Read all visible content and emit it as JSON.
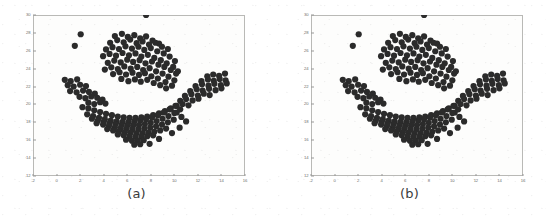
{
  "figure": {
    "background_color": "#ffffff",
    "point_color": "#2b2b2b",
    "frame_color": "#b9b9b6",
    "tick_color": "#6e6e6b"
  },
  "panels": [
    {
      "id": "a",
      "caption": "(a)"
    },
    {
      "id": "b",
      "caption": "(b)"
    }
  ],
  "chart_data": [
    {
      "type": "scatter",
      "title": "",
      "caption": "(a)",
      "xlabel": "",
      "ylabel": "",
      "xlim": [
        -2,
        16
      ],
      "ylim": [
        12,
        30
      ],
      "xticks": [
        -2,
        0,
        2,
        4,
        6,
        8,
        10,
        12,
        14,
        16
      ],
      "xticklabels": [
        "-2",
        "0",
        "2",
        "4",
        "6",
        "8",
        "10",
        "12",
        "14",
        "16"
      ],
      "yticks": [
        12,
        14,
        16,
        18,
        20,
        22,
        24,
        26,
        28,
        30
      ],
      "yticklabels": [
        "12",
        "14",
        "16",
        "18",
        "20",
        "22",
        "24",
        "26",
        "28",
        "30"
      ],
      "grid": false,
      "legend": null,
      "marker": "circle",
      "marker_size": 3.1,
      "series": [
        {
          "name": "points",
          "color": "#2b2b2b",
          "x": [
            2.05,
            1.55,
            4.95,
            5.55,
            6.05,
            6.6,
            7.1,
            7.6,
            8.15,
            8.7,
            4.55,
            5.15,
            5.7,
            6.25,
            6.8,
            7.3,
            7.85,
            8.4,
            8.95,
            9.45,
            4.2,
            4.75,
            5.3,
            5.85,
            6.4,
            6.95,
            7.45,
            8.0,
            8.55,
            9.1,
            9.6,
            10.05,
            3.95,
            4.5,
            5.05,
            5.6,
            6.15,
            6.7,
            7.2,
            7.75,
            8.3,
            8.85,
            9.35,
            9.9,
            10.3,
            4.35,
            4.9,
            5.45,
            6.0,
            6.5,
            7.05,
            7.55,
            8.1,
            8.65,
            9.15,
            9.7,
            10.15,
            4.1,
            4.65,
            5.2,
            5.75,
            6.3,
            6.85,
            7.35,
            7.9,
            8.45,
            9.0,
            9.5,
            10.0,
            4.8,
            5.35,
            5.9,
            6.45,
            7.0,
            7.5,
            8.05,
            8.6,
            9.25,
            9.8,
            5.5,
            6.1,
            6.65,
            7.15,
            7.7,
            8.25,
            8.8,
            9.3,
            0.7,
            1.2,
            1.75,
            0.95,
            1.45,
            2.0,
            2.5,
            1.15,
            1.7,
            2.25,
            2.75,
            3.25,
            1.95,
            2.45,
            2.95,
            3.45,
            3.9,
            2.7,
            3.2,
            3.7,
            4.15,
            12.8,
            13.3,
            13.8,
            14.3,
            12.3,
            12.85,
            13.35,
            13.85,
            14.35,
            11.8,
            12.35,
            12.9,
            13.4,
            13.95,
            14.45,
            11.35,
            11.9,
            12.4,
            12.95,
            13.5,
            14.0,
            10.9,
            11.45,
            12.0,
            12.5,
            13.0,
            10.5,
            11.0,
            11.55,
            12.05,
            10.2,
            10.7,
            11.2,
            2.2,
            2.7,
            3.2,
            3.7,
            4.2,
            4.7,
            5.2,
            5.7,
            6.2,
            6.7,
            7.2,
            7.7,
            8.2,
            8.7,
            9.2,
            9.7,
            10.2,
            2.6,
            3.1,
            3.6,
            4.1,
            4.6,
            5.1,
            5.6,
            6.1,
            6.6,
            7.1,
            7.6,
            8.1,
            8.6,
            9.1,
            9.6,
            10.1,
            10.6,
            3.0,
            3.5,
            4.0,
            4.5,
            5.0,
            5.5,
            6.0,
            6.5,
            7.0,
            7.5,
            8.0,
            8.5,
            9.0,
            9.5,
            10.0,
            10.5,
            11.0,
            3.4,
            3.95,
            4.45,
            4.95,
            5.45,
            5.95,
            6.45,
            6.95,
            7.45,
            7.95,
            8.45,
            8.95,
            9.45,
            9.95,
            10.45,
            4.3,
            4.8,
            5.3,
            5.8,
            6.3,
            6.8,
            7.3,
            7.8,
            8.3,
            8.8,
            9.3,
            9.8,
            5.2,
            5.7,
            6.2,
            6.7,
            7.2,
            7.7,
            8.2,
            8.7,
            5.9,
            6.4,
            6.9,
            7.4,
            7.9,
            6.6,
            7.1,
            7.6
          ],
          "y": [
            27.85,
            26.55,
            27.65,
            27.9,
            27.55,
            27.75,
            27.4,
            27.6,
            27.15,
            26.8,
            26.9,
            27.2,
            26.95,
            27.25,
            26.85,
            27.05,
            26.7,
            26.9,
            26.45,
            26.2,
            26.15,
            26.4,
            26.2,
            26.5,
            26.25,
            26.45,
            26.1,
            26.3,
            25.95,
            25.7,
            25.35,
            24.85,
            25.4,
            25.65,
            25.45,
            25.75,
            25.5,
            25.7,
            25.35,
            25.55,
            25.2,
            24.95,
            24.6,
            24.2,
            23.7,
            24.65,
            24.9,
            24.7,
            25.0,
            24.75,
            24.95,
            24.6,
            24.8,
            24.45,
            24.2,
            23.85,
            23.45,
            23.9,
            24.15,
            23.95,
            24.25,
            24.0,
            24.2,
            23.85,
            24.05,
            23.7,
            23.45,
            23.1,
            22.7,
            23.4,
            23.6,
            23.35,
            23.55,
            23.3,
            23.5,
            23.15,
            22.9,
            22.5,
            22.1,
            22.85,
            22.6,
            22.8,
            22.55,
            22.75,
            22.4,
            22.15,
            21.8,
            22.75,
            22.6,
            22.8,
            22.15,
            22.0,
            22.2,
            22.05,
            21.5,
            21.35,
            21.55,
            21.4,
            21.2,
            20.85,
            20.7,
            20.9,
            20.75,
            20.55,
            20.2,
            20.05,
            20.25,
            20.1,
            23.15,
            23.35,
            23.2,
            23.45,
            22.6,
            22.8,
            22.65,
            22.85,
            22.7,
            22.05,
            22.25,
            22.1,
            22.3,
            22.15,
            22.35,
            21.5,
            21.7,
            21.55,
            21.75,
            21.6,
            21.8,
            20.95,
            21.15,
            21.0,
            21.2,
            21.05,
            20.4,
            20.6,
            20.45,
            20.65,
            19.85,
            20.05,
            19.9,
            19.7,
            19.55,
            19.35,
            19.15,
            18.95,
            18.8,
            18.65,
            18.55,
            18.5,
            18.5,
            18.55,
            18.65,
            18.8,
            19.0,
            19.25,
            19.55,
            19.1,
            18.9,
            18.7,
            18.5,
            18.35,
            18.2,
            18.1,
            18.05,
            18.05,
            18.1,
            18.2,
            18.35,
            18.55,
            18.8,
            19.1,
            19.45,
            19.85,
            18.6,
            18.4,
            18.2,
            18.05,
            17.9,
            17.8,
            17.7,
            17.65,
            17.65,
            17.7,
            17.8,
            17.95,
            18.15,
            18.4,
            18.7,
            19.05,
            19.45,
            18.1,
            17.9,
            17.75,
            17.6,
            17.45,
            17.35,
            17.3,
            17.25,
            17.25,
            17.3,
            17.4,
            17.55,
            17.75,
            18.0,
            18.3,
            17.4,
            17.25,
            17.1,
            17.0,
            16.9,
            16.85,
            16.8,
            16.8,
            16.85,
            16.95,
            17.1,
            17.3,
            16.8,
            16.65,
            16.55,
            16.45,
            16.4,
            16.4,
            16.45,
            16.55,
            16.15,
            16.05,
            15.95,
            15.95,
            16.0,
            15.6,
            15.5,
            15.55
          ]
        }
      ]
    },
    {
      "type": "scatter",
      "title": "",
      "caption": "(b)",
      "xlabel": "",
      "ylabel": "",
      "xlim": [
        -2,
        16
      ],
      "ylim": [
        12,
        30
      ],
      "xticks": [
        -2,
        0,
        2,
        4,
        6,
        8,
        10,
        12,
        14,
        16
      ],
      "xticklabels": [
        "-2",
        "0",
        "2",
        "4",
        "6",
        "8",
        "10",
        "12",
        "14",
        "16"
      ],
      "yticks": [
        12,
        14,
        16,
        18,
        20,
        22,
        24,
        26,
        28,
        30
      ],
      "yticklabels": [
        "12",
        "14",
        "16",
        "18",
        "20",
        "22",
        "24",
        "26",
        "28",
        "30"
      ],
      "grid": false,
      "legend": null,
      "marker": "circle",
      "marker_size": 3.1,
      "series": [
        {
          "name": "points",
          "color": "#2b2b2b",
          "x": [
            2.05,
            1.55,
            4.95,
            5.55,
            6.05,
            6.6,
            7.1,
            7.6,
            8.15,
            8.7,
            4.55,
            5.15,
            5.7,
            6.25,
            6.8,
            7.3,
            7.85,
            8.4,
            8.95,
            9.45,
            4.2,
            4.75,
            5.3,
            5.85,
            6.4,
            6.95,
            7.45,
            8.0,
            8.55,
            9.1,
            9.6,
            10.05,
            3.95,
            4.5,
            5.05,
            5.6,
            6.15,
            6.7,
            7.2,
            7.75,
            8.3,
            8.85,
            9.35,
            9.9,
            10.3,
            4.35,
            4.9,
            5.45,
            6.0,
            6.5,
            7.05,
            7.55,
            8.1,
            8.65,
            9.15,
            9.7,
            10.15,
            4.1,
            4.65,
            5.2,
            5.75,
            6.3,
            6.85,
            7.35,
            7.9,
            8.45,
            9.0,
            9.5,
            10.0,
            4.8,
            5.35,
            5.9,
            6.45,
            7.0,
            7.5,
            8.05,
            8.6,
            9.25,
            9.8,
            5.5,
            6.1,
            6.65,
            7.15,
            7.7,
            8.25,
            8.8,
            9.3,
            0.7,
            1.2,
            1.75,
            0.95,
            1.45,
            2.0,
            2.5,
            1.15,
            1.7,
            2.25,
            2.75,
            3.25,
            1.95,
            2.45,
            2.95,
            3.45,
            3.9,
            2.7,
            3.2,
            3.7,
            4.15,
            12.8,
            13.3,
            13.8,
            14.3,
            12.3,
            12.85,
            13.35,
            13.85,
            14.35,
            11.8,
            12.35,
            12.9,
            13.4,
            13.95,
            14.45,
            11.35,
            11.9,
            12.4,
            12.95,
            13.5,
            14.0,
            10.9,
            11.45,
            12.0,
            12.5,
            13.0,
            10.5,
            11.0,
            11.55,
            12.05,
            10.2,
            10.7,
            11.2,
            2.2,
            2.7,
            3.2,
            3.7,
            4.2,
            4.7,
            5.2,
            5.7,
            6.2,
            6.7,
            7.2,
            7.7,
            8.2,
            8.7,
            9.2,
            9.7,
            10.2,
            2.6,
            3.1,
            3.6,
            4.1,
            4.6,
            5.1,
            5.6,
            6.1,
            6.6,
            7.1,
            7.6,
            8.1,
            8.6,
            9.1,
            9.6,
            10.1,
            10.6,
            3.0,
            3.5,
            4.0,
            4.5,
            5.0,
            5.5,
            6.0,
            6.5,
            7.0,
            7.5,
            8.0,
            8.5,
            9.0,
            9.5,
            10.0,
            10.5,
            11.0,
            3.4,
            3.95,
            4.45,
            4.95,
            5.45,
            5.95,
            6.45,
            6.95,
            7.45,
            7.95,
            8.45,
            8.95,
            9.45,
            9.95,
            10.45,
            4.3,
            4.8,
            5.3,
            5.8,
            6.3,
            6.8,
            7.3,
            7.8,
            8.3,
            8.8,
            9.3,
            9.8,
            5.2,
            5.7,
            6.2,
            6.7,
            7.2,
            7.7,
            8.2,
            8.7,
            5.9,
            6.4,
            6.9,
            7.4,
            7.9,
            6.6,
            7.1,
            7.6
          ],
          "y": [
            27.85,
            26.55,
            27.65,
            27.9,
            27.55,
            27.75,
            27.4,
            27.6,
            27.15,
            26.8,
            26.9,
            27.2,
            26.95,
            27.25,
            26.85,
            27.05,
            26.7,
            26.9,
            26.45,
            26.2,
            26.15,
            26.4,
            26.2,
            26.5,
            26.25,
            26.45,
            26.1,
            26.3,
            25.95,
            25.7,
            25.35,
            24.85,
            25.4,
            25.65,
            25.45,
            25.75,
            25.5,
            25.7,
            25.35,
            25.55,
            25.2,
            24.95,
            24.6,
            24.2,
            23.7,
            24.65,
            24.9,
            24.7,
            25.0,
            24.75,
            24.95,
            24.6,
            24.8,
            24.45,
            24.2,
            23.85,
            23.45,
            23.9,
            24.15,
            23.95,
            24.25,
            24.0,
            24.2,
            23.85,
            24.05,
            23.7,
            23.45,
            23.1,
            22.7,
            23.4,
            23.6,
            23.35,
            23.55,
            23.3,
            23.5,
            23.15,
            22.9,
            22.5,
            22.1,
            22.85,
            22.6,
            22.8,
            22.55,
            22.75,
            22.4,
            22.15,
            21.8,
            22.75,
            22.6,
            22.8,
            22.15,
            22.0,
            22.2,
            22.05,
            21.5,
            21.35,
            21.55,
            21.4,
            21.2,
            20.85,
            20.7,
            20.9,
            20.75,
            20.55,
            20.2,
            20.05,
            20.25,
            20.1,
            23.15,
            23.35,
            23.2,
            23.45,
            22.6,
            22.8,
            22.65,
            22.85,
            22.7,
            22.05,
            22.25,
            22.1,
            22.3,
            22.15,
            22.35,
            21.5,
            21.7,
            21.55,
            21.75,
            21.6,
            21.8,
            20.95,
            21.15,
            21.0,
            21.2,
            21.05,
            20.4,
            20.6,
            20.45,
            20.65,
            19.85,
            20.05,
            19.9,
            19.7,
            19.55,
            19.35,
            19.15,
            18.95,
            18.8,
            18.65,
            18.55,
            18.5,
            18.5,
            18.55,
            18.65,
            18.8,
            19.0,
            19.25,
            19.55,
            19.1,
            18.9,
            18.7,
            18.5,
            18.35,
            18.2,
            18.1,
            18.05,
            18.05,
            18.1,
            18.2,
            18.35,
            18.55,
            18.8,
            19.1,
            19.45,
            19.85,
            18.6,
            18.4,
            18.2,
            18.05,
            17.9,
            17.8,
            17.7,
            17.65,
            17.65,
            17.7,
            17.8,
            17.95,
            18.15,
            18.4,
            18.7,
            19.05,
            19.45,
            18.1,
            17.9,
            17.75,
            17.6,
            17.45,
            17.35,
            17.3,
            17.25,
            17.25,
            17.3,
            17.4,
            17.55,
            17.75,
            18.0,
            18.3,
            17.4,
            17.25,
            17.1,
            17.0,
            16.9,
            16.85,
            16.8,
            16.8,
            16.85,
            16.95,
            17.1,
            17.3,
            16.8,
            16.65,
            16.55,
            16.45,
            16.4,
            16.4,
            16.45,
            16.55,
            16.15,
            16.05,
            15.95,
            15.95,
            16.0,
            15.6,
            15.5,
            15.55
          ]
        }
      ]
    }
  ]
}
